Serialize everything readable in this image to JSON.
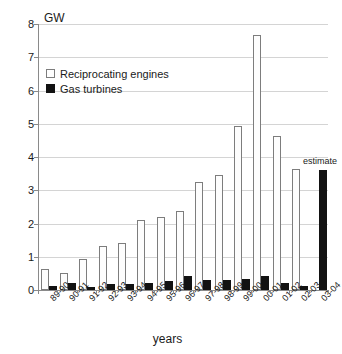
{
  "chart_data": {
    "type": "bar",
    "title": "",
    "subtitle": "",
    "xlabel": "years",
    "ylabel": "GW",
    "unit_label": "GW",
    "ylim": [
      0,
      8
    ],
    "ytick_labels": [
      "0",
      "1",
      "2",
      "3",
      "4",
      "5",
      "6",
      "7",
      "8"
    ],
    "ytick_values": [
      0,
      1,
      2,
      3,
      4,
      5,
      6,
      7,
      8
    ],
    "grid": true,
    "legend_position": "upper-left-inside",
    "categories": [
      "89-90",
      "90-91",
      "91-92",
      "92-93",
      "93-94",
      "94-95",
      "95-96",
      "96-97",
      "97-98",
      "98-99",
      "99-00",
      "00-01",
      "01-02",
      "02-03",
      "03-04"
    ],
    "series": [
      {
        "name": "Reciprocating engines",
        "color": "#ffffff",
        "values": [
          0.62,
          0.5,
          0.92,
          1.32,
          1.42,
          2.12,
          2.21,
          2.37,
          3.24,
          3.45,
          4.94,
          7.68,
          4.64,
          3.64,
          0.0
        ]
      },
      {
        "name": "Gas turbines",
        "color": "#121212",
        "values": [
          0.12,
          0.22,
          0.1,
          0.19,
          0.17,
          0.21,
          0.26,
          0.42,
          0.31,
          0.31,
          0.32,
          0.43,
          0.21,
          0.12,
          3.6
        ]
      }
    ],
    "annotations": [
      {
        "text": "estimate",
        "category": "03-04",
        "value": 3.6
      }
    ]
  },
  "legend": {
    "items": [
      {
        "label": "Reciprocating engines",
        "swatch": "white-square-outline"
      },
      {
        "label": "Gas turbines",
        "swatch": "black-square-filled"
      }
    ]
  },
  "axes": {
    "y_unit": "GW",
    "x_title": "years"
  }
}
